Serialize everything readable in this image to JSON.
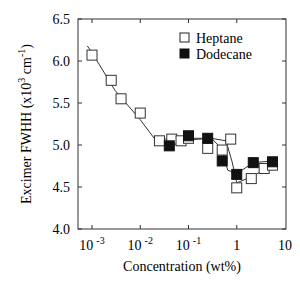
{
  "chart_data": {
    "type": "scatter",
    "title": "",
    "xlabel": "Concentration (wt%)",
    "ylabel": "Excimer FWHH (x10^3 cm^-1)",
    "xscale": "log",
    "xlim": [
      0.0006,
      10
    ],
    "ylim": [
      4.0,
      6.5
    ],
    "x_ticks": [
      {
        "value": 0.001,
        "base": "10",
        "exp": "-3"
      },
      {
        "value": 0.01,
        "base": "10",
        "exp": "-2"
      },
      {
        "value": 0.1,
        "base": "10",
        "exp": "-1"
      },
      {
        "value": 1,
        "base": "1",
        "exp": ""
      },
      {
        "value": 10,
        "base": "10",
        "exp": ""
      }
    ],
    "y_ticks": [
      "4.0",
      "4.5",
      "5.0",
      "5.5",
      "6.0",
      "6.5"
    ],
    "grid": false,
    "legend_position": "upper right",
    "series": [
      {
        "name": "Heptane",
        "marker": "open-square",
        "points": [
          [
            0.001,
            6.07
          ],
          [
            0.0025,
            5.77
          ],
          [
            0.004,
            5.55
          ],
          [
            0.01,
            5.38
          ],
          [
            0.025,
            5.05
          ],
          [
            0.045,
            5.07
          ],
          [
            0.07,
            5.05
          ],
          [
            0.1,
            5.08
          ],
          [
            0.25,
            4.96
          ],
          [
            0.5,
            4.94
          ],
          [
            0.75,
            5.07
          ],
          [
            1.0,
            4.49
          ],
          [
            2.0,
            4.6
          ],
          [
            3.7,
            4.72
          ],
          [
            5.5,
            4.76
          ]
        ]
      },
      {
        "name": "Dodecane",
        "marker": "filled-square",
        "points": [
          [
            0.04,
            4.99
          ],
          [
            0.1,
            5.11
          ],
          [
            0.25,
            5.08
          ],
          [
            0.5,
            4.81
          ],
          [
            1.0,
            4.65
          ],
          [
            2.2,
            4.79
          ],
          [
            5.5,
            4.8
          ]
        ]
      }
    ],
    "fit_curves": [
      {
        "name": "Heptane fit",
        "points": [
          [
            0.0008,
            6.18
          ],
          [
            0.001,
            6.1
          ],
          [
            0.003,
            5.65
          ],
          [
            0.01,
            5.3
          ],
          [
            0.02,
            5.07
          ],
          [
            0.05,
            5.07
          ],
          [
            0.1,
            5.08
          ],
          [
            0.3,
            5.08
          ],
          [
            0.6,
            5.05
          ],
          [
            0.8,
            4.8
          ],
          [
            1.0,
            4.55
          ],
          [
            2.0,
            4.62
          ],
          [
            5.5,
            4.76
          ]
        ]
      },
      {
        "name": "Dodecane fit",
        "points": [
          [
            0.05,
            5.05
          ],
          [
            0.3,
            5.08
          ],
          [
            0.5,
            4.95
          ],
          [
            0.65,
            4.7
          ],
          [
            1.0,
            4.66
          ],
          [
            2.2,
            4.79
          ],
          [
            5.5,
            4.81
          ]
        ]
      }
    ]
  },
  "legend": {
    "items": [
      {
        "label": "Heptane",
        "marker": "open-square"
      },
      {
        "label": "Dodecane",
        "marker": "filled-square"
      }
    ]
  },
  "axes": {
    "xlabel": "Concentration (wt%)",
    "ylabel_main": "Excimer FWHH (x10",
    "ylabel_sup1": "3",
    "ylabel_mid": " cm",
    "ylabel_sup2": "-1",
    "ylabel_end": ")"
  }
}
